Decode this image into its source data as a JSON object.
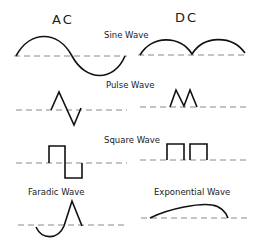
{
  "headers": {
    "left": "AC",
    "right": "DC"
  },
  "labels": {
    "sine": "Sine Wave",
    "pulse": "Pulse Wave",
    "square": "Square Wave",
    "faradic": "Faradic Wave",
    "exponential": "Exponential Wave"
  },
  "colors": {
    "wave": "#111111",
    "axis": "#888888",
    "background": "#ffffff"
  }
}
